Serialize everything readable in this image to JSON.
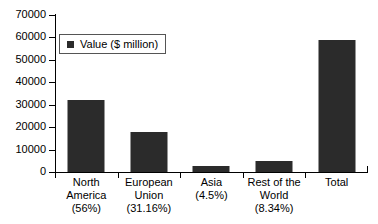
{
  "chart_data": {
    "type": "bar",
    "title": "",
    "xlabel": "",
    "ylabel": "",
    "ylim": [
      0,
      70000
    ],
    "ystep": 10000,
    "grid": false,
    "legend_position": "inside-top-left",
    "categories": [
      "North America\n(56%)",
      "European Union\n(31.16%)",
      "Asia\n(4.5%)",
      "Rest of the World\n(8.34%)",
      "Total"
    ],
    "category_lines": [
      [
        "North",
        "America",
        "(56%)"
      ],
      [
        "European",
        "Union",
        "(31.16%)"
      ],
      [
        "Asia",
        "(4.5%)"
      ],
      [
        "Rest of the",
        "World",
        "(8.34%)"
      ],
      [
        "Total"
      ]
    ],
    "series": [
      {
        "name": "Value ($ million)",
        "color": "#2b2b2b",
        "values": [
          32000,
          18000,
          2600,
          4900,
          59000
        ]
      }
    ],
    "ytick_labels": [
      "70000",
      "60000",
      "50000",
      "40000",
      "30000",
      "20000",
      "10000",
      "0"
    ],
    "ytick_values": [
      70000,
      60000,
      50000,
      40000,
      30000,
      20000,
      10000,
      0
    ]
  },
  "legend": {
    "label": "Value ($ million)",
    "marker_color": "#2b2b2b"
  },
  "colors": {
    "bar": "#2b2b2b",
    "axis": "#000000",
    "background": "#ffffff",
    "legend_border": "#555555"
  }
}
